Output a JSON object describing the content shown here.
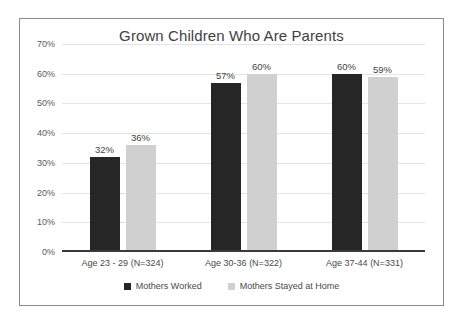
{
  "chart_data": {
    "type": "bar",
    "title": "Grown Children Who Are Parents",
    "xlabel": "",
    "ylabel": "",
    "ylim": [
      0,
      70
    ],
    "ytick_labels": [
      "70%",
      "60%",
      "50%",
      "40%",
      "30%",
      "20%",
      "10%",
      "0%"
    ],
    "ytick_values": [
      70,
      60,
      50,
      40,
      30,
      20,
      10,
      0
    ],
    "grid": true,
    "legend_position": "bottom",
    "categories": [
      "Age 23 - 29 (N=324)",
      "Age 30-36 (N=322)",
      "Age 37-44 (N=331)"
    ],
    "series": [
      {
        "name": "Mothers Worked",
        "color": "#262626",
        "values": [
          32,
          57,
          60
        ],
        "labels": [
          "32%",
          "57%",
          "60%"
        ]
      },
      {
        "name": "Mothers Stayed at Home",
        "color": "#d0d0d0",
        "values": [
          36,
          60,
          59
        ],
        "labels": [
          "36%",
          "60%",
          "59%"
        ]
      }
    ]
  }
}
